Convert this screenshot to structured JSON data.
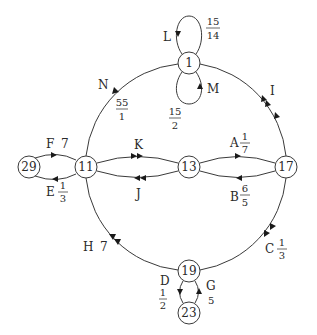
{
  "diagram": {
    "type": "directed-multigraph",
    "nodes": [
      {
        "id": "1",
        "label": "1",
        "x": 189,
        "y": 63
      },
      {
        "id": "11",
        "label": "11",
        "x": 86,
        "y": 167
      },
      {
        "id": "13",
        "label": "13",
        "x": 189,
        "y": 167
      },
      {
        "id": "17",
        "label": "17",
        "x": 286,
        "y": 167
      },
      {
        "id": "29",
        "label": "29",
        "x": 29,
        "y": 167
      },
      {
        "id": "19",
        "label": "19",
        "x": 189,
        "y": 271
      },
      {
        "id": "23",
        "label": "23",
        "x": 189,
        "y": 313
      }
    ],
    "edges": [
      {
        "id": "A",
        "from": "13",
        "to": "17",
        "label": "A",
        "weight": {
          "num": "1",
          "den": "7"
        }
      },
      {
        "id": "B",
        "from": "17",
        "to": "13",
        "label": "B",
        "weight": {
          "num": "6",
          "den": "5"
        }
      },
      {
        "id": "C",
        "from": "17",
        "to": "19",
        "label": "C",
        "weight": {
          "num": "1",
          "den": "3"
        }
      },
      {
        "id": "D",
        "from": "19",
        "to": "23",
        "label": "D",
        "weight": {
          "num": "1",
          "den": "2"
        }
      },
      {
        "id": "E",
        "from": "11",
        "to": "29",
        "label": "E",
        "weight": {
          "num": "1",
          "den": "3"
        }
      },
      {
        "id": "F",
        "from": "29",
        "to": "11",
        "label": "F",
        "weight": "7"
      },
      {
        "id": "G",
        "from": "23",
        "to": "19",
        "label": "G",
        "weight": "5"
      },
      {
        "id": "H",
        "from": "19",
        "to": "11",
        "label": "H",
        "weight": "7"
      },
      {
        "id": "I",
        "from": "17",
        "to": "1",
        "label": "I",
        "weight": null
      },
      {
        "id": "J",
        "from": "13",
        "to": "11",
        "label": "J",
        "weight": null
      },
      {
        "id": "K",
        "from": "11",
        "to": "13",
        "label": "K",
        "weight": null
      },
      {
        "id": "L",
        "from": "1",
        "to": "1",
        "label": "L",
        "weight": {
          "num": "15",
          "den": "14"
        }
      },
      {
        "id": "M",
        "from": "1",
        "to": "1",
        "label": "M",
        "weight": {
          "num": "15",
          "den": "2"
        }
      },
      {
        "id": "N",
        "from": "1",
        "to": "11",
        "label": "N",
        "weight": {
          "num": "55",
          "den": "1"
        }
      }
    ]
  },
  "labels": {
    "A": "A",
    "A_num": "1",
    "A_den": "7",
    "B": "B",
    "B_num": "6",
    "B_den": "5",
    "C": "C",
    "C_num": "1",
    "C_den": "3",
    "D": "D",
    "D_num": "1",
    "D_den": "2",
    "E": "E",
    "E_num": "1",
    "E_den": "3",
    "F": "F",
    "F_w": "7",
    "G": "G",
    "G_w": "5",
    "H": "H",
    "H_w": "7",
    "I": "I",
    "J": "J",
    "K": "K",
    "L": "L",
    "L_num": "15",
    "L_den": "14",
    "M": "M",
    "M_num": "15",
    "M_den": "2",
    "N": "N",
    "N_num": "55",
    "N_den": "1"
  },
  "node_labels": {
    "n1": "1",
    "n11": "11",
    "n13": "13",
    "n17": "17",
    "n29": "29",
    "n19": "19",
    "n23": "23"
  }
}
